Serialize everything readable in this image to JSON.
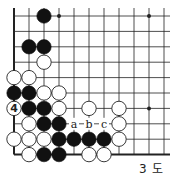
{
  "diagram": {
    "type": "go-board-fragment",
    "caption": "3 도",
    "grid": {
      "columns": 11,
      "rows": 10,
      "origin_x": 14,
      "origin_y": 16,
      "spacing_x": 15,
      "spacing_y": 15.4,
      "edges": [
        "left",
        "bottom"
      ]
    },
    "colors": {
      "line": "#222222",
      "black_stone": "#111111",
      "white_stone": "#ffffff",
      "background": "#ffffff"
    },
    "star_points": [
      {
        "col": 3,
        "row": 0
      },
      {
        "col": 9,
        "row": 0
      },
      {
        "col": 9,
        "row": 6
      }
    ],
    "black_stones": [
      {
        "col": 2,
        "row": 0
      },
      {
        "col": 1,
        "row": 2
      },
      {
        "col": 2,
        "row": 2
      },
      {
        "col": 0,
        "row": 5
      },
      {
        "col": 1,
        "row": 5
      },
      {
        "col": 1,
        "row": 6
      },
      {
        "col": 2,
        "row": 6
      },
      {
        "col": 2,
        "row": 7
      },
      {
        "col": 3,
        "row": 7
      },
      {
        "col": 3,
        "row": 8
      },
      {
        "col": 4,
        "row": 8
      },
      {
        "col": 5,
        "row": 8
      },
      {
        "col": 6,
        "row": 8
      },
      {
        "col": 2,
        "row": 9
      },
      {
        "col": 3,
        "row": 9
      }
    ],
    "white_stones": [
      {
        "col": 2,
        "row": 3
      },
      {
        "col": 0,
        "row": 4
      },
      {
        "col": 1,
        "row": 4
      },
      {
        "col": 2,
        "row": 5
      },
      {
        "col": 3,
        "row": 5
      },
      {
        "col": 0,
        "row": 6,
        "label": "4"
      },
      {
        "col": 3,
        "row": 6
      },
      {
        "col": 5,
        "row": 6
      },
      {
        "col": 7,
        "row": 6
      },
      {
        "col": 1,
        "row": 7
      },
      {
        "col": 7,
        "row": 7
      },
      {
        "col": 0,
        "row": 8
      },
      {
        "col": 1,
        "row": 8
      },
      {
        "col": 2,
        "row": 8
      },
      {
        "col": 7,
        "row": 8
      },
      {
        "col": 1,
        "row": 9
      },
      {
        "col": 5,
        "row": 9
      },
      {
        "col": 6,
        "row": 9
      }
    ],
    "point_labels": [
      {
        "col": 4,
        "row": 7,
        "text": "a"
      },
      {
        "col": 5,
        "row": 7,
        "text": "b"
      },
      {
        "col": 6,
        "row": 7,
        "text": "c"
      }
    ]
  }
}
